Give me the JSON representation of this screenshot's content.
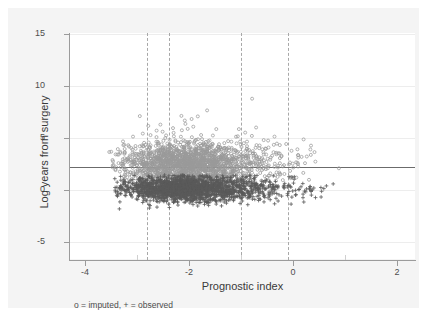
{
  "chart_data": {
    "type": "scatter",
    "title": "",
    "xlabel": "Prognostic index",
    "ylabel": "Log years from surgery",
    "xlim": [
      -4.45,
      2.2
    ],
    "ylim": [
      -6.0,
      15.9
    ],
    "xticks": [
      -4,
      -2,
      0,
      2
    ],
    "xtick_labels": [
      "-4",
      "-2",
      "0",
      "2"
    ],
    "xticks_minor": [
      -3,
      -1,
      1
    ],
    "yticks": [
      -5,
      0,
      5,
      10,
      15
    ],
    "ytick_labels": [
      "-5",
      "0",
      "5",
      "10",
      "15"
    ],
    "grid": "horizontal-faint",
    "legend_position": "below-axis-left",
    "legend_text": "o = imputed, + = observed",
    "series": [
      {
        "name": "imputed",
        "marker": "o",
        "color": "#9a9a9a",
        "description": "Hollow circles, concentrated above the reference line, centered near y = 3.2, x from -3.6 to 1.3",
        "n_approx": 1800,
        "x_range": [
          -3.7,
          1.4
        ],
        "y_range": [
          1.6,
          11.3
        ],
        "y_center": 3.3
      },
      {
        "name": "observed",
        "marker": "+",
        "color": "#5a5a5a",
        "description": "Plus markers, concentrated below the reference line, centered near y = 0.9, x from -3.5 to 1.5",
        "n_approx": 2000,
        "x_range": [
          -3.6,
          1.5
        ],
        "y_range": [
          -2.4,
          2.2
        ],
        "y_center": 0.9
      }
    ],
    "reference_lines": {
      "horizontal": [
        {
          "y": 2.2,
          "style": "solid",
          "color": "#6b6b6b"
        }
      ],
      "vertical": [
        {
          "x": -2.82,
          "style": "dashed",
          "color": "#a8a8a8"
        },
        {
          "x": -2.38,
          "style": "dashed",
          "color": "#a8a8a8"
        },
        {
          "x": -1.0,
          "style": "dashed",
          "color": "#a8a8a8"
        },
        {
          "x": -0.1,
          "style": "dashed",
          "color": "#a8a8a8"
        }
      ]
    },
    "colors": {
      "canvas": "#f4f4f4",
      "plot_background": "#ffffff",
      "axis": "#9b9b9b",
      "gridline": "#ededed",
      "tick_label": "#4d4d4d",
      "axis_title": "#3a3a3a"
    }
  }
}
